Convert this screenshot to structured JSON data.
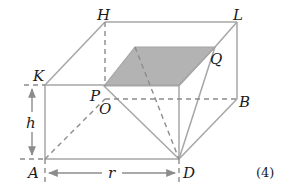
{
  "diagram": {
    "caption": "(4)",
    "colors": {
      "line": "#a6a6a6",
      "dashed": "#8c8c8c",
      "shade": "#b3b3b3",
      "text": "#1a1a1a"
    },
    "labels": {
      "H": "H",
      "L": "L",
      "K": "K",
      "Q": "Q",
      "P": "P",
      "O": "O",
      "B": "B",
      "h": "h",
      "A": "A",
      "r": "r",
      "D": "D"
    }
  }
}
